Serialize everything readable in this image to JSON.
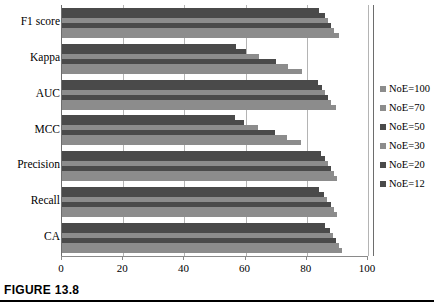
{
  "caption": {
    "text": "FIGURE 13.8"
  },
  "chart_data": {
    "type": "bar",
    "orientation": "horizontal",
    "title": "",
    "xlabel": "",
    "ylabel": "",
    "xlim": [
      0,
      100
    ],
    "xticks": [
      0,
      20,
      40,
      60,
      80,
      100
    ],
    "grid": true,
    "legend_position": "right",
    "categories": [
      "F1 score",
      "Kappa",
      "AUC",
      "MCC",
      "Precision",
      "Recall",
      "CA"
    ],
    "series": [
      {
        "name": "NoE=100",
        "color": "#8c8c8c",
        "values": [
          90.5,
          78.5,
          89.5,
          78.0,
          90.0,
          90.0,
          91.5
        ]
      },
      {
        "name": "NoE=70",
        "color": "#8c8c8c",
        "values": [
          89.0,
          74.0,
          88.0,
          73.5,
          89.0,
          89.0,
          90.5
        ]
      },
      {
        "name": "NoE=50",
        "color": "#4a4a4a",
        "values": [
          88.0,
          70.0,
          87.0,
          69.5,
          88.0,
          88.0,
          89.5
        ]
      },
      {
        "name": "NoE=30",
        "color": "#8c8c8c",
        "values": [
          87.0,
          64.5,
          86.0,
          64.0,
          87.0,
          86.5,
          88.5
        ]
      },
      {
        "name": "NoE=20",
        "color": "#4a4a4a",
        "values": [
          86.0,
          60.0,
          85.0,
          59.5,
          86.0,
          85.5,
          87.5
        ]
      },
      {
        "name": "NoE=12",
        "color": "#4a4a4a",
        "values": [
          84.0,
          57.0,
          83.5,
          56.5,
          84.5,
          84.0,
          86.0
        ]
      }
    ]
  },
  "legend": {
    "items": [
      {
        "label": "NoE=100",
        "color": "#8c8c8c"
      },
      {
        "label": "NoE=70",
        "color": "#8c8c8c"
      },
      {
        "label": "NoE=50",
        "color": "#4a4a4a"
      },
      {
        "label": "NoE=30",
        "color": "#8c8c8c"
      },
      {
        "label": "NoE=20",
        "color": "#4a4a4a"
      },
      {
        "label": "NoE=12",
        "color": "#4a4a4a"
      }
    ]
  }
}
